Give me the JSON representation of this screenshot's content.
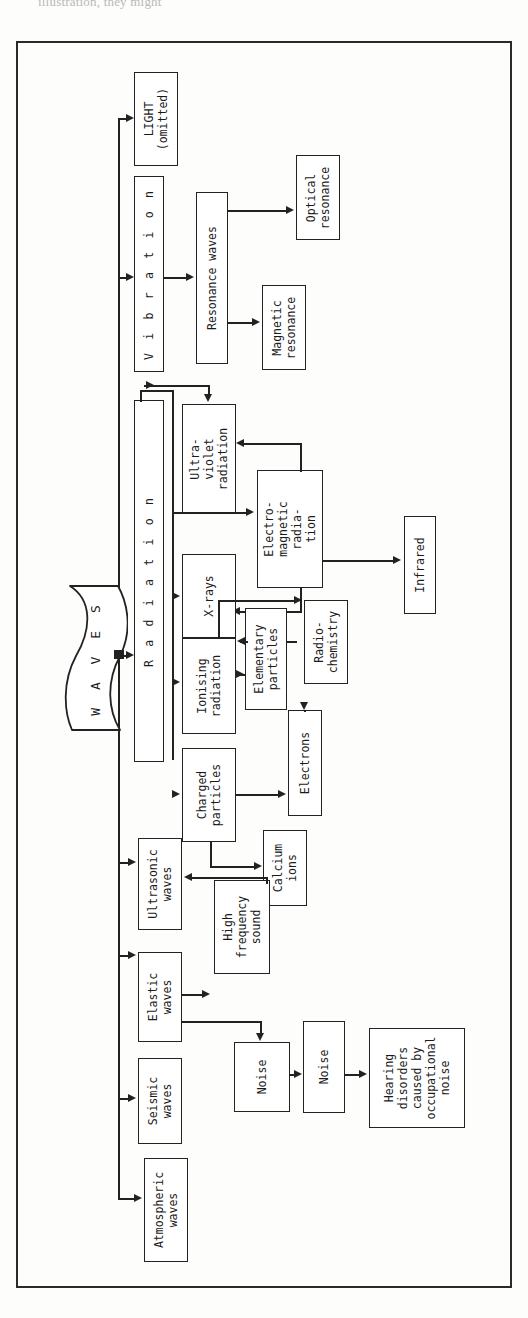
{
  "page": {
    "caption_partial": "illustration, they might",
    "frame": {
      "border_color": "#2a2a2a",
      "background": "#fdfdfc"
    }
  },
  "diagram": {
    "title": "WAVES",
    "orientation": "rotated-90-landscape",
    "root": {
      "label": "W A V E S",
      "shape": "wavy-banner"
    },
    "nodes": [
      {
        "id": "light",
        "label": "LIGHT\n(omitted)"
      },
      {
        "id": "vibration",
        "label": "Vibration"
      },
      {
        "id": "resonance-waves",
        "label": "Resonance waves"
      },
      {
        "id": "optical-resonance",
        "label": "Optical\nresonance"
      },
      {
        "id": "magnetic-resonance",
        "label": "Magnetic\nresonance"
      },
      {
        "id": "radiation",
        "label": "Radiation"
      },
      {
        "id": "ultra-violet",
        "label": "Ultra-\nviolet\nradiation"
      },
      {
        "id": "electro-magnetic",
        "label": "Electro-\nmagnetic\nradia-\ntion"
      },
      {
        "id": "infrared",
        "label": "Infrared"
      },
      {
        "id": "x-rays",
        "label": "X-rays"
      },
      {
        "id": "ionising",
        "label": "Ionising\nradiation"
      },
      {
        "id": "elementary",
        "label": "Elementary\nparticles"
      },
      {
        "id": "radio-chemistry",
        "label": "Radio-\nchemistry"
      },
      {
        "id": "charged-particles",
        "label": "Charged\nparticles"
      },
      {
        "id": "electrons",
        "label": "Electrons"
      },
      {
        "id": "calcium-ions",
        "label": "Calcium\nions"
      },
      {
        "id": "ultrasonic",
        "label": "Ultrasonic\nwaves"
      },
      {
        "id": "high-frequency",
        "label": "High\nfrequency\nsound"
      },
      {
        "id": "elastic-waves",
        "label": "Elastic\nwaves"
      },
      {
        "id": "seismic-waves",
        "label": "Seismic\nwaves"
      },
      {
        "id": "noise",
        "label": "Noise"
      },
      {
        "id": "occupational-noise",
        "label": "Occupational\nnoise"
      },
      {
        "id": "hearing-disorders",
        "label": "Hearing\ndisorders\ncaused by\noccupational\nnoise"
      },
      {
        "id": "atmospheric-waves",
        "label": "Atmospheric\nwaves"
      }
    ],
    "edges": [
      {
        "from": "root",
        "to": "light"
      },
      {
        "from": "root",
        "to": "vibration"
      },
      {
        "from": "root",
        "to": "radiation"
      },
      {
        "from": "root",
        "to": "ultrasonic"
      },
      {
        "from": "root",
        "to": "elastic-waves"
      },
      {
        "from": "root",
        "to": "seismic-waves"
      },
      {
        "from": "root",
        "to": "atmospheric-waves"
      },
      {
        "from": "vibration",
        "to": "resonance-waves"
      },
      {
        "from": "resonance-waves",
        "to": "optical-resonance"
      },
      {
        "from": "resonance-waves",
        "to": "magnetic-resonance"
      },
      {
        "from": "radiation",
        "to": "ultra-violet"
      },
      {
        "from": "radiation",
        "to": "electro-magnetic"
      },
      {
        "from": "radiation",
        "to": "x-rays"
      },
      {
        "from": "radiation",
        "to": "ionising"
      },
      {
        "from": "radiation",
        "to": "charged-particles"
      },
      {
        "from": "electro-magnetic",
        "to": "ultra-violet"
      },
      {
        "from": "electro-magnetic",
        "to": "x-rays"
      },
      {
        "from": "electro-magnetic",
        "to": "infrared"
      },
      {
        "from": "ionising",
        "to": "elementary"
      },
      {
        "from": "elementary",
        "to": "ionising"
      },
      {
        "from": "elementary",
        "to": "electrons"
      },
      {
        "from": "ionising",
        "to": "radio-chemistry"
      },
      {
        "from": "elementary",
        "to": "radio-chemistry"
      },
      {
        "from": "charged-particles",
        "to": "electrons"
      },
      {
        "from": "charged-particles",
        "to": "calcium-ions"
      },
      {
        "from": "high-frequency",
        "to": "ultrasonic"
      },
      {
        "from": "elastic-waves",
        "to": "high-frequency"
      },
      {
        "from": "elastic-waves",
        "to": "noise"
      },
      {
        "from": "noise",
        "to": "occupational-noise"
      },
      {
        "from": "occupational-noise",
        "to": "hearing-disorders"
      }
    ]
  }
}
